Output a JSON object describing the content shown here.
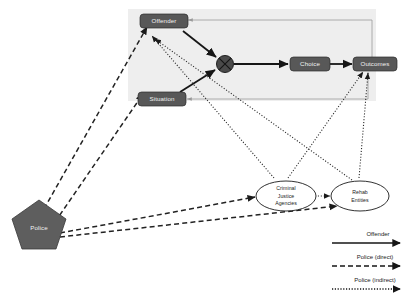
{
  "diagram": {
    "panel": {
      "name": "decision-panel"
    },
    "nodes": {
      "offender": {
        "label": "Offender",
        "shape": "rounded-rect"
      },
      "situation": {
        "label": "Situation",
        "shape": "rounded-rect"
      },
      "choice": {
        "label": "Choice",
        "shape": "rounded-rect"
      },
      "outcomes": {
        "label": "Outcomes",
        "shape": "rounded-rect"
      },
      "interaction": {
        "label": "",
        "shape": "circle-x"
      },
      "police": {
        "label": "Police",
        "shape": "pentagon"
      },
      "criminal_justice_agencies": {
        "label": "Criminal Justice Agencies",
        "lines": [
          "Criminal",
          "Justice",
          "Agencies"
        ],
        "shape": "ellipse"
      },
      "rehab_entities": {
        "label": "Rehab Entities",
        "lines": [
          "Rehab",
          "Entities"
        ],
        "shape": "ellipse"
      }
    },
    "colors": {
      "box_fill": "#585858",
      "box_text": "#f2f2f2",
      "pentagon_fill": "#5e5e5e",
      "panel_bg": "#eeeeee",
      "ellipse_fill": "#ffffff",
      "edge_solid": "#161616",
      "edge_feedback": "#9a9a9a",
      "page_bg": "#ffffff"
    }
  },
  "legend": {
    "items": [
      {
        "label": "Offender",
        "style": "solid"
      },
      {
        "label": "Police (direct)",
        "style": "dashed"
      },
      {
        "label": "Police (indirect)",
        "style": "dotted"
      }
    ]
  }
}
